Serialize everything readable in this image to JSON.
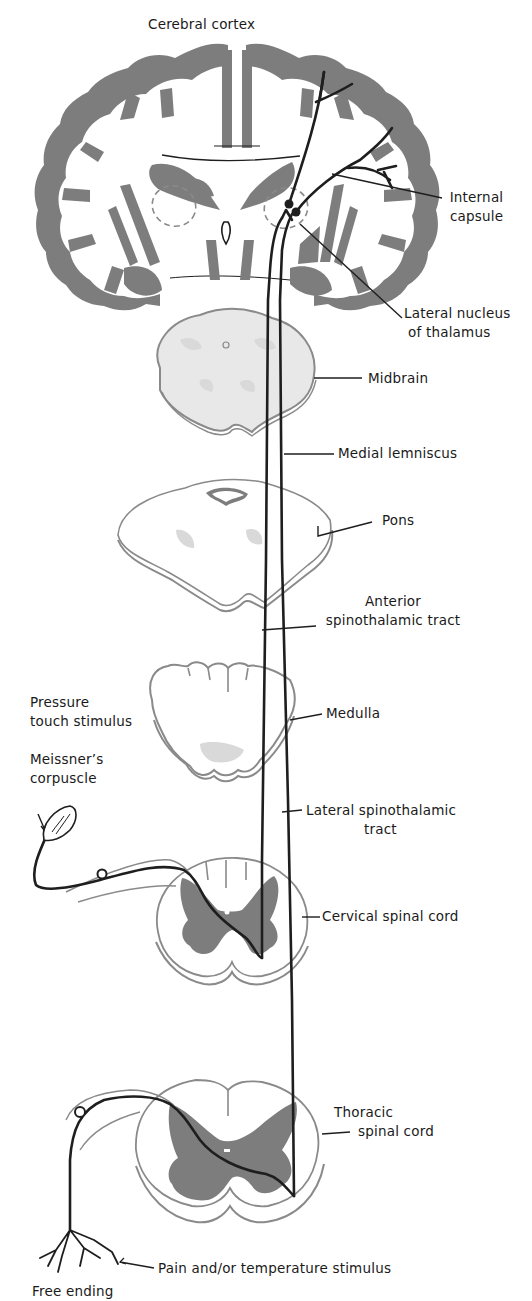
{
  "diagram": {
    "colors": {
      "gray_matter": "#7d7d7d",
      "outline": "#8a8a8a",
      "tract": "#1e1e1e",
      "background": "#ffffff"
    },
    "structures": [
      {
        "id": "cortex",
        "label": "Cerebral cortex"
      },
      {
        "id": "internal-capsule",
        "label_lines": [
          "Internal",
          "capsule"
        ]
      },
      {
        "id": "thalamus",
        "label_lines": [
          "Lateral nucleus",
          "of thalamus"
        ]
      },
      {
        "id": "midbrain",
        "label": "Midbrain"
      },
      {
        "id": "medial-lemniscus",
        "label": "Medial lemniscus"
      },
      {
        "id": "pons",
        "label": "Pons"
      },
      {
        "id": "anterior-st",
        "label_lines": [
          "Anterior",
          "spinothalamic tract"
        ]
      },
      {
        "id": "medulla",
        "label": "Medulla"
      },
      {
        "id": "pressure",
        "label_lines": [
          "Pressure",
          "touch stimulus"
        ]
      },
      {
        "id": "meissner",
        "label_lines": [
          "Meissner's",
          "corpuscle"
        ]
      },
      {
        "id": "lateral-st",
        "label_lines": [
          "Lateral spinothalamic",
          "tract"
        ]
      },
      {
        "id": "cervical",
        "label": "Cervical spinal cord"
      },
      {
        "id": "thoracic",
        "label_lines": [
          "Thoracic",
          "spinal cord"
        ]
      },
      {
        "id": "pain",
        "label": "Pain and/or temperature stimulus"
      },
      {
        "id": "free-ending",
        "label": "Free ending"
      }
    ]
  },
  "labels": {
    "cortex": "Cerebral cortex",
    "internal_capsule_1": "Internal",
    "internal_capsule_2": "capsule",
    "thalamus_1": "Lateral nucleus",
    "thalamus_2": "of thalamus",
    "midbrain": "Midbrain",
    "medial_lemniscus": "Medial lemniscus",
    "pons": "Pons",
    "anterior_1": "Anterior",
    "anterior_2": "spinothalamic tract",
    "medulla": "Medulla",
    "pressure_1": "Pressure",
    "pressure_2": "touch stimulus",
    "meissner_1": "Meissner’s",
    "meissner_2": "corpuscle",
    "lateral_1": "Lateral spinothalamic",
    "lateral_2": "tract",
    "cervical": "Cervical spinal cord",
    "thoracic_1": "Thoracic",
    "thoracic_2": "spinal cord",
    "pain": "Pain and/or temperature stimulus",
    "free_ending": "Free ending"
  }
}
